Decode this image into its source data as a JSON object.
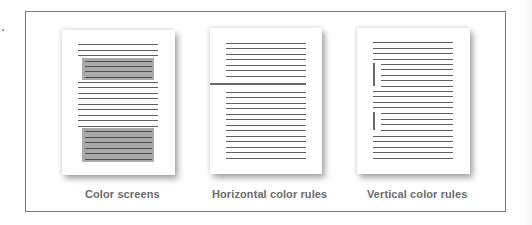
{
  "figure": {
    "panels": [
      {
        "id": "color-screens",
        "label": "Color screens"
      },
      {
        "id": "horizontal-rules",
        "label": "Horizontal color rules"
      },
      {
        "id": "vertical-rules",
        "label": "Vertical color rules"
      }
    ]
  },
  "colors": {
    "frame": "#7a7a7a",
    "text_lines": "#5f5f5f",
    "screen_fill": "#a9a9a9",
    "rule": "#6a6a6a",
    "label": "#6b6b6b"
  }
}
